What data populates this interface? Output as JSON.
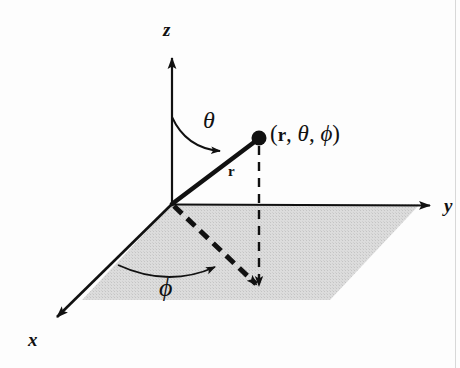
{
  "figure": {
    "background_color": "#fdfdfd",
    "stroke_color": "#111111",
    "plane_fill_color": "#d9d9d9",
    "axes": [
      {
        "name": "z",
        "label": "z",
        "label_x": 163,
        "label_y": 20,
        "from": [
          172,
          204
        ],
        "to": [
          172,
          48
        ]
      },
      {
        "name": "y",
        "label": "y",
        "label_x": 444,
        "label_y": 196,
        "from": [
          172,
          204
        ],
        "to": [
          438,
          205
        ]
      },
      {
        "name": "x",
        "label": "x",
        "label_x": 28,
        "label_y": 330,
        "from": [
          172,
          204
        ],
        "to": [
          48,
          326
        ]
      }
    ],
    "origin": [
      172,
      204
    ],
    "point": {
      "name": "coordinate-point",
      "x": 259,
      "y": 138,
      "radius": 7,
      "label": "(r, θ, φ)",
      "label_parts": {
        "open": "(",
        "r": "r",
        "sep1": ", ",
        "theta": "θ",
        "sep2": ", ",
        "phi": "ϕ",
        "close": ")"
      },
      "label_x": 270,
      "label_y": 122
    },
    "radius_vector": {
      "name": "radius-vector",
      "from": [
        172,
        204
      ],
      "to": [
        259,
        138
      ],
      "label": "r",
      "label_x": 228,
      "label_y": 164
    },
    "theta_angle": {
      "name": "theta-angle",
      "label": "θ",
      "label_x": 203,
      "label_y": 108,
      "arc_start": [
        172,
        117
      ],
      "arc_end": [
        228,
        157
      ],
      "arc_control": [
        196,
        150
      ]
    },
    "phi_angle": {
      "name": "phi-angle",
      "label": "ϕ",
      "label_x": 159,
      "label_y": 275,
      "arc_start": [
        118,
        265
      ],
      "arc_end": [
        225,
        268
      ],
      "arc_control": [
        170,
        283
      ]
    },
    "projection_lines": [
      {
        "name": "azimuthal-projection-line",
        "from": [
          172,
          204
        ],
        "to": [
          259,
          292
        ],
        "style": "dashed-thick"
      },
      {
        "name": "vertical-drop-line",
        "from": [
          259,
          138
        ],
        "to": [
          259,
          293
        ],
        "style": "dashed-thin"
      }
    ],
    "plane": {
      "name": "xy-plane",
      "corners": [
        [
          172,
          204
        ],
        [
          420,
          204
        ],
        [
          330,
          300
        ],
        [
          82,
          300
        ]
      ]
    },
    "page_edge_x": 455
  }
}
